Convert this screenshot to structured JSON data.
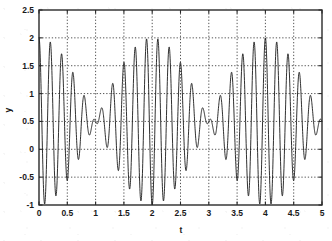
{
  "chart_data": {
    "type": "line",
    "title": "",
    "xlabel": "t",
    "ylabel": "y",
    "xlim": [
      0,
      5
    ],
    "ylim": [
      -1,
      2.5
    ],
    "grid": true,
    "grid_style": "dotted",
    "legend": null,
    "line_color": "#1a1a1a",
    "background_color": "#ffffff",
    "xticks": [
      "0",
      "0.5",
      "1",
      "1.5",
      "2",
      "2.5",
      "3",
      "3.5",
      "4",
      "4.5",
      "5"
    ],
    "xtick_values": [
      0,
      0.5,
      1,
      1.5,
      2,
      2.5,
      3,
      3.5,
      4,
      4.5,
      5
    ],
    "yticks": [
      "2.5",
      "2",
      "1.5",
      "1",
      "0.5",
      "0",
      "-0.5",
      "-1"
    ],
    "ytick_values": [
      2.5,
      2,
      1.5,
      1,
      0.5,
      0,
      -0.5,
      -1
    ],
    "series": [
      {
        "name": "y(t)",
        "description": "Beat waveform: sum of two close-frequency sinusoids on a constant offset",
        "formula": "y = 0.5 + 0.75*cos(2*pi*5.25*t) + 0.75*cos(2*pi*4.75*t)",
        "offset": 0.5,
        "components": [
          {
            "amplitude": 0.75,
            "frequency_hz": 5.25,
            "phase": 0
          },
          {
            "amplitude": 0.75,
            "frequency_hz": 4.75,
            "phase": 0
          }
        ],
        "beat_period": 2.0,
        "observed_max": 1.97,
        "observed_min": -0.65,
        "samples_per_unit": 400
      }
    ],
    "annotations": [
      {
        "t": 0.06,
        "y": 1.33,
        "note": "first local peak"
      },
      {
        "t": 0.3,
        "y": -0.62,
        "note": "early trough"
      },
      {
        "t": 0.5,
        "y": 1.5,
        "note": "envelope node crossing at gridline"
      },
      {
        "t": 0.9,
        "y": 1.97,
        "note": "envelope maximum"
      },
      {
        "t": 1.5,
        "y": -0.5,
        "note": "envelope node crossing at gridline"
      },
      {
        "t": 2.5,
        "y": 1.5,
        "note": "envelope node crossing at gridline"
      },
      {
        "t": 2.9,
        "y": 1.97,
        "note": "envelope maximum"
      },
      {
        "t": 3.5,
        "y": -0.5,
        "note": "envelope node crossing at gridline"
      },
      {
        "t": 4.5,
        "y": 1.5,
        "note": "envelope node crossing at gridline"
      },
      {
        "t": 4.9,
        "y": 1.97,
        "note": "envelope maximum"
      }
    ]
  },
  "axes": {
    "x_title": "t",
    "y_title": "y"
  }
}
